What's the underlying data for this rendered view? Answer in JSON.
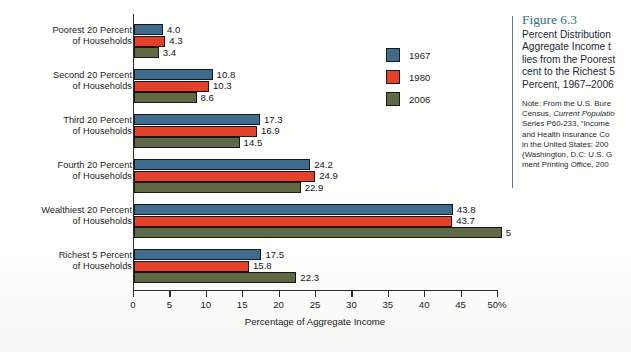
{
  "chart_data": {
    "type": "bar",
    "orientation": "horizontal",
    "xlabel": "Percentage of Aggregate Income",
    "ylabel": "",
    "xlim": [
      0,
      50
    ],
    "xticks": [
      0,
      5,
      10,
      15,
      20,
      25,
      30,
      35,
      40,
      45,
      50
    ],
    "xtick_labels": [
      "0",
      "5",
      "10",
      "15",
      "20",
      "25",
      "30",
      "35",
      "40",
      "45",
      "50%"
    ],
    "grid": false,
    "legend_position": "upper-right-inside",
    "categories": [
      "Poorest 20 Percent of Households",
      "Second 20 Percent of Households",
      "Third 20 Percent of Households",
      "Fourth 20 Percent of Households",
      "Wealthiest 20 Percent of Households",
      "Richest 5 Percent of Households"
    ],
    "series": [
      {
        "name": "1967",
        "color": "#3f6b8c",
        "values": [
          4.0,
          10.8,
          17.3,
          24.2,
          43.8,
          17.5
        ]
      },
      {
        "name": "1980",
        "color": "#e3412a",
        "values": [
          4.3,
          10.3,
          16.9,
          24.9,
          43.7,
          15.8
        ]
      },
      {
        "name": "2006",
        "color": "#5f6a45",
        "values": [
          3.4,
          8.6,
          14.5,
          22.9,
          50.5,
          22.3
        ]
      }
    ],
    "value_labels": [
      [
        "4.0",
        "4.3",
        "3.4"
      ],
      [
        "10.8",
        "10.3",
        "8.6"
      ],
      [
        "17.3",
        "16.9",
        "14.5"
      ],
      [
        "24.2",
        "24.9",
        "22.9"
      ],
      [
        "43.8",
        "43.7",
        "5"
      ],
      [
        "17.5",
        "15.8",
        "22.3"
      ]
    ]
  },
  "axis": {
    "x_title": "Percentage of Aggregate Income"
  },
  "category_labels": [
    {
      "line1": "Poorest 20 Percent",
      "line2": "of Households"
    },
    {
      "line1": "Second 20 Percent",
      "line2": "of Households"
    },
    {
      "line1": "Third 20 Percent",
      "line2": "of Households"
    },
    {
      "line1": "Fourth 20 Percent",
      "line2": "of Households"
    },
    {
      "line1": "Wealthiest 20 Percent",
      "line2": "of Households"
    },
    {
      "line1": "Richest 5 Percent",
      "line2": "of Households"
    }
  ],
  "legend": {
    "items": [
      {
        "label": "1967",
        "color": "#3f6b8c"
      },
      {
        "label": "1980",
        "color": "#e3412a"
      },
      {
        "label": "2006",
        "color": "#5f6a45"
      }
    ]
  },
  "caption": {
    "figure_number": "Figure 6.3",
    "title_lines": [
      "Percent Distribution",
      "Aggregate Income t",
      "lies from the Poorest",
      "cent to the Richest 5",
      "Percent, 1967–2006"
    ],
    "note_lines": [
      "Note: From the U.S. Bure",
      "Census, Current Populatio",
      "Series P60-233, “Income",
      "and Health Insurance Co",
      "in the United States: 200",
      "(Washington, D.C: U.S. G",
      "ment Printing Office, 200"
    ]
  }
}
